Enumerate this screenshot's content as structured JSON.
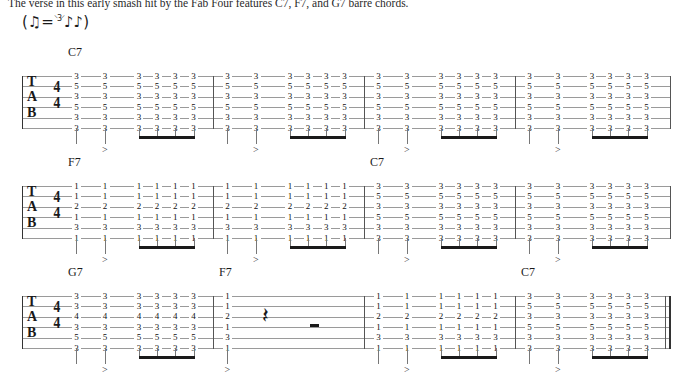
{
  "intro": {
    "text": "The verse in this early smash hit by the Fab Four features C7, F7, and G7 barre chords."
  },
  "tempo": {
    "open_paren": "(",
    "straight": "♫",
    "equals": "=",
    "swing": "♪♪",
    "triplet_bracket": "⸌3⸍",
    "close_paren": ")"
  },
  "clef": {
    "letters": [
      "T",
      "A",
      "B"
    ],
    "time_numerator": "4",
    "time_denominator": "4"
  },
  "symbols": {
    "accent": ">",
    "quarter_rest": "𝄽",
    "half_rest": "half-rest-bar"
  },
  "chords": {
    "C7": {
      "name": "C7",
      "frets": [
        "3",
        "5",
        "3",
        "5",
        "3",
        "3"
      ]
    },
    "F7": {
      "name": "F7",
      "frets": [
        "1",
        "1",
        "2",
        "1",
        "3",
        "1"
      ]
    },
    "G7": {
      "name": "G7",
      "frets": [
        "3",
        "3",
        "4",
        "3",
        "5",
        "3"
      ]
    }
  },
  "rhythm": {
    "pattern": "quarter, accented-quarter, four-beamed-eighths",
    "beats_per_measure": 4
  },
  "systems": [
    {
      "id": "system-1",
      "measures": [
        {
          "chord": "C7",
          "label": "C7",
          "label_shown": true,
          "type": "chord"
        },
        {
          "chord": "C7",
          "label": "",
          "label_shown": false,
          "type": "chord"
        },
        {
          "chord": "C7",
          "label": "",
          "label_shown": false,
          "type": "chord"
        },
        {
          "chord": "C7",
          "label": "",
          "label_shown": false,
          "type": "chord"
        }
      ]
    },
    {
      "id": "system-2",
      "measures": [
        {
          "chord": "F7",
          "label": "F7",
          "label_shown": true,
          "type": "chord"
        },
        {
          "chord": "F7",
          "label": "",
          "label_shown": false,
          "type": "chord"
        },
        {
          "chord": "C7",
          "label": "C7",
          "label_shown": true,
          "type": "chord"
        },
        {
          "chord": "C7",
          "label": "",
          "label_shown": false,
          "type": "chord"
        }
      ]
    },
    {
      "id": "system-3",
      "measures": [
        {
          "chord": "G7",
          "label": "G7",
          "label_shown": true,
          "type": "chord"
        },
        {
          "chord": "F7",
          "label": "F7",
          "label_shown": true,
          "type": "chord-then-rest"
        },
        {
          "chord": "F7",
          "label": "",
          "label_shown": false,
          "type": "chord"
        },
        {
          "chord": "C7",
          "label": "C7",
          "label_shown": true,
          "type": "chord",
          "final": true
        }
      ]
    }
  ],
  "colors": {
    "ink": "#1a1a1a",
    "staff_line": "#9a9a9a",
    "stem": "#777777",
    "beam": "#1a1a1a",
    "background": "#ffffff"
  }
}
